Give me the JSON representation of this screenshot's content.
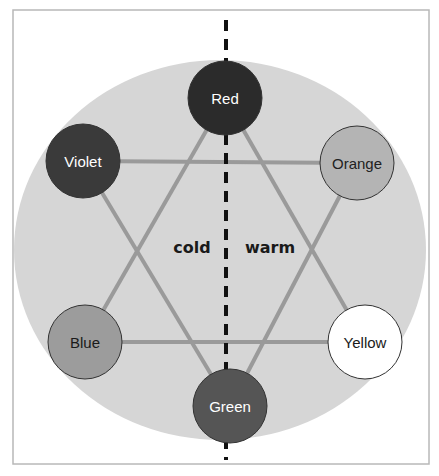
{
  "diagram": {
    "type": "color-wheel-hexagram",
    "frame": {
      "x": 13,
      "y": 10,
      "width": 416,
      "height": 454,
      "stroke": "#b8b8b8"
    },
    "background_ellipse": {
      "cx": 220,
      "cy": 250,
      "rx": 206,
      "ry": 190,
      "fill": "#d6d6d6"
    },
    "divider": {
      "x": 226,
      "y1": 20,
      "y2": 460,
      "color": "#111111",
      "dash": "11 8",
      "width": 4
    },
    "connector_color": "#9a9a9a",
    "nodes": [
      {
        "id": "red",
        "label": "Red",
        "cx": 225,
        "cy": 98,
        "r": 37,
        "fill": "#2b2b2b",
        "text_color": "#ffffff"
      },
      {
        "id": "violet",
        "label": "Violet",
        "cx": 83,
        "cy": 161,
        "r": 37,
        "fill": "#3a3a3a",
        "text_color": "#ffffff"
      },
      {
        "id": "orange",
        "label": "Orange",
        "cx": 357,
        "cy": 163,
        "r": 37,
        "fill": "#b4b4b4",
        "text_color": "#222222"
      },
      {
        "id": "blue",
        "label": "Blue",
        "cx": 85,
        "cy": 342,
        "r": 37,
        "fill": "#9c9c9c",
        "text_color": "#1a1a1a"
      },
      {
        "id": "yellow",
        "label": "Yellow",
        "cx": 365,
        "cy": 342,
        "r": 37,
        "fill": "#ffffff",
        "text_color": "#1a1a1a"
      },
      {
        "id": "green",
        "label": "Green",
        "cx": 230,
        "cy": 406,
        "r": 37,
        "fill": "#555555",
        "text_color": "#ffffff"
      }
    ],
    "edges": [
      [
        "red",
        "blue"
      ],
      [
        "red",
        "yellow"
      ],
      [
        "blue",
        "yellow"
      ],
      [
        "violet",
        "orange"
      ],
      [
        "violet",
        "green"
      ],
      [
        "orange",
        "green"
      ]
    ],
    "side_labels": [
      {
        "text": "cold",
        "x": 192,
        "y": 247
      },
      {
        "text": "warm",
        "x": 270,
        "y": 247
      }
    ]
  }
}
